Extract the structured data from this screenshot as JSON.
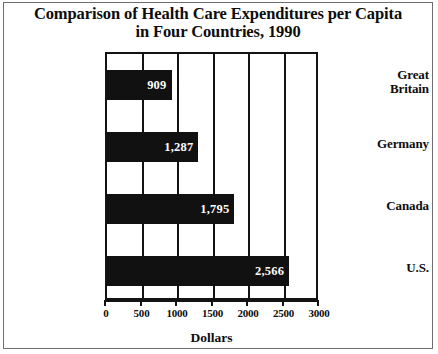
{
  "figure": {
    "title_line1": "Comparison of Health Care Expenditures per Capita",
    "title_line2": "in Four Countries, 1990"
  },
  "chart_data": {
    "type": "bar",
    "orientation": "horizontal",
    "title": "Comparison of Health Care Expenditures per Capita in Four Countries, 1990",
    "categories": [
      "Great Britain",
      "Germany",
      "Canada",
      "U.S."
    ],
    "values": [
      909,
      1287,
      1795,
      2566
    ],
    "value_labels": [
      "909",
      "1,287",
      "1,795",
      "2,566"
    ],
    "category_labels": [
      {
        "line1": "Great",
        "line2": "Britain"
      },
      {
        "line1": "Germany",
        "line2": ""
      },
      {
        "line1": "Canada",
        "line2": ""
      },
      {
        "line1": "U.S.",
        "line2": ""
      }
    ],
    "xlabel": "Dollars",
    "ylabel": "",
    "xlim": [
      0,
      3000
    ],
    "xticks": [
      0,
      500,
      1000,
      1500,
      2000,
      2500,
      3000
    ],
    "xtick_labels": [
      "0",
      "500",
      "1000",
      "1500",
      "2000",
      "2500",
      "3000"
    ],
    "grid": true,
    "grid_axis": "x",
    "legend": null,
    "bar_color": "#111111",
    "value_label_color": "#ffffff",
    "axis_color": "#131313",
    "background_color": "#ffffff"
  }
}
